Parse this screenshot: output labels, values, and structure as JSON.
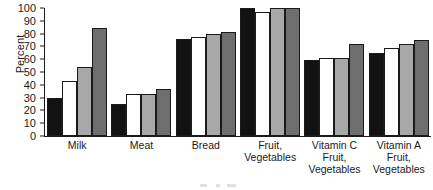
{
  "chart_data": {
    "type": "bar",
    "title": "",
    "subtitle": "",
    "xlabel": "",
    "ylabel": "Percent",
    "ylim": [
      0,
      100
    ],
    "ytick_step": 10,
    "yticks": [
      0,
      10,
      20,
      30,
      40,
      50,
      60,
      70,
      80,
      90,
      100
    ],
    "grid": false,
    "legend": "none",
    "categories": [
      "Milk",
      "Meat",
      "Bread",
      "Fruit, Vegetables",
      "Vitamin C Fruit, Vegetables",
      "Vitamin A Fruit, Vegetables"
    ],
    "category_lines": [
      [
        "Milk"
      ],
      [
        "Meat"
      ],
      [
        "Bread"
      ],
      [
        "Fruit,",
        "Vegetables"
      ],
      [
        "Vitamin C",
        "Fruit,",
        "Vegetables"
      ],
      [
        "Vitamin A",
        "Fruit,",
        "Vegetables"
      ]
    ],
    "series": [
      {
        "name": "Series 1",
        "fill": "#121212",
        "values": [
          30,
          25,
          76,
          100,
          59,
          65
        ]
      },
      {
        "name": "Series 2",
        "fill": "#ffffff",
        "values": [
          43,
          33,
          77,
          97,
          61,
          69
        ]
      },
      {
        "name": "Series 3",
        "fill": "#a8a8a8",
        "values": [
          54,
          33,
          80,
          100,
          61,
          72
        ]
      },
      {
        "name": "Series 4",
        "fill": "#6e6e6e",
        "values": [
          84,
          37,
          81,
          100,
          72,
          75
        ]
      }
    ]
  },
  "axis": {
    "y_title": "Percent",
    "tick_labels": [
      "100",
      "90",
      "80",
      "70",
      "60",
      "50",
      "40",
      "30",
      "20",
      "10",
      "0"
    ]
  },
  "colors": {
    "ink": "#1a1a1a",
    "background": "#ffffff",
    "series_1": "#121212",
    "series_2": "#ffffff",
    "series_3": "#a8a8a8",
    "series_4": "#6e6e6e"
  }
}
